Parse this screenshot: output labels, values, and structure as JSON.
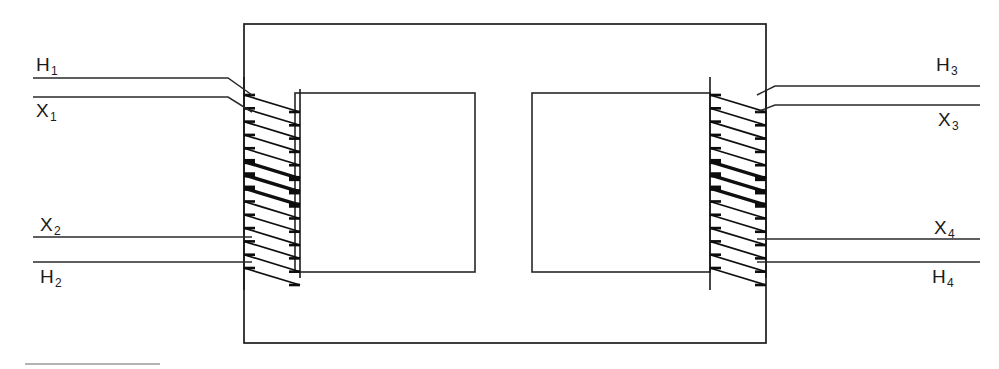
{
  "diagram": {
    "type": "transformer-core-winding-schematic",
    "canvas": {
      "width": 999,
      "height": 369,
      "background": "#ffffff"
    },
    "line_color": "#1d1d1d",
    "core": {
      "name": "outer-core-rectangle",
      "x": 244,
      "y": 24,
      "width": 522,
      "height": 319
    },
    "windows": [
      {
        "name": "left-core-window",
        "x": 295,
        "y": 93,
        "width": 180,
        "height": 179
      },
      {
        "name": "right-core-window",
        "x": 532,
        "y": 93,
        "width": 178,
        "height": 179
      }
    ],
    "windings": [
      {
        "name": "left-winding",
        "left_post_x": 244,
        "right_post_x": 300,
        "top_y": 95,
        "bottom_y": 268,
        "turns": 14,
        "turn_slope_px": 17,
        "heavy_turn_indices": [
          5,
          6,
          7
        ]
      },
      {
        "name": "right-winding",
        "left_post_x": 710,
        "right_post_x": 766,
        "top_y": 95,
        "bottom_y": 268,
        "turns": 14,
        "turn_slope_px": 17,
        "heavy_turn_indices": [
          5,
          6,
          7
        ]
      }
    ],
    "leads": [
      {
        "name": "lead-h1",
        "side": "left",
        "label": "H",
        "subscript": "1",
        "outer_y": 78,
        "inner_y": 95,
        "x_start": 33,
        "x_bend": 228,
        "x_end": 252,
        "label_position": "above"
      },
      {
        "name": "lead-x1",
        "side": "left",
        "label": "X",
        "subscript": "1",
        "outer_y": 97,
        "inner_y": 112,
        "x_start": 33,
        "x_bend": 228,
        "x_end": 252,
        "label_position": "below"
      },
      {
        "name": "lead-x2",
        "side": "left",
        "label": "X",
        "subscript": "2",
        "outer_y": 237,
        "inner_y": 237,
        "x_start": 33,
        "x_bend": 228,
        "x_end": 252,
        "label_position": "above"
      },
      {
        "name": "lead-h2",
        "side": "left",
        "label": "H",
        "subscript": "2",
        "outer_y": 262,
        "inner_y": 262,
        "x_start": 33,
        "x_bend": 228,
        "x_end": 252,
        "label_position": "below"
      },
      {
        "name": "lead-h3",
        "side": "right",
        "label": "H",
        "subscript": "3",
        "outer_y": 86,
        "inner_y": 95,
        "x_start": 980,
        "x_bend": 775,
        "x_end": 757,
        "label_position": "above"
      },
      {
        "name": "lead-x3",
        "side": "right",
        "label": "X",
        "subscript": "3",
        "outer_y": 105,
        "inner_y": 112,
        "x_start": 980,
        "x_bend": 775,
        "x_end": 757,
        "label_position": "below"
      },
      {
        "name": "lead-x4",
        "side": "right",
        "label": "X",
        "subscript": "4",
        "outer_y": 239,
        "inner_y": 239,
        "x_start": 980,
        "x_bend": 775,
        "x_end": 757,
        "label_position": "above"
      },
      {
        "name": "lead-h4",
        "side": "right",
        "label": "H",
        "subscript": "4",
        "outer_y": 262,
        "inner_y": 262,
        "x_start": 980,
        "x_bend": 775,
        "x_end": 757,
        "label_position": "below"
      }
    ],
    "labels": [
      {
        "name": "label-h1",
        "text": "H",
        "subscript": "1",
        "x": 36,
        "y": 55
      },
      {
        "name": "label-x1",
        "text": "X",
        "subscript": "1",
        "x": 36,
        "y": 101
      },
      {
        "name": "label-x2",
        "text": "X",
        "subscript": "2",
        "x": 40,
        "y": 215
      },
      {
        "name": "label-h2",
        "text": "H",
        "subscript": "2",
        "x": 40,
        "y": 267
      },
      {
        "name": "label-h3",
        "text": "H",
        "subscript": "3",
        "x": 936,
        "y": 55
      },
      {
        "name": "label-x3",
        "text": "X",
        "subscript": "3",
        "x": 938,
        "y": 110
      },
      {
        "name": "label-x4",
        "text": "X",
        "subscript": "4",
        "x": 934,
        "y": 218
      },
      {
        "name": "label-h4",
        "text": "H",
        "subscript": "4",
        "x": 932,
        "y": 267
      }
    ],
    "artifact": {
      "name": "scan-artifact-rule",
      "x1": 25,
      "y1": 364,
      "x2": 160,
      "y2": 364
    }
  }
}
